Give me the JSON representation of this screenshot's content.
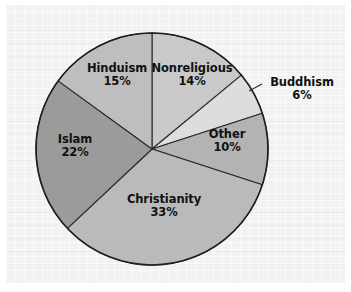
{
  "chart_data": {
    "type": "pie",
    "title": "",
    "subtitle": "",
    "xlabel": "",
    "ylabel": "",
    "legend_position": "none",
    "grid": false,
    "units": "percent",
    "total": 100,
    "start_angle_deg": 0,
    "direction": "clockwise",
    "categories": [
      "Nonreligious",
      "Buddhism",
      "Other",
      "Christianity",
      "Islam",
      "Hinduism"
    ],
    "values": [
      14,
      6,
      10,
      33,
      22,
      15
    ],
    "slices": [
      {
        "label": "Nonreligious",
        "value": 14,
        "pct_text": "14%",
        "color": "#c9c9c9",
        "label_placement": "inside"
      },
      {
        "label": "Buddhism",
        "value": 6,
        "pct_text": "6%",
        "color": "#dddddd",
        "label_placement": "outside",
        "has_leader_line": true
      },
      {
        "label": "Other",
        "value": 10,
        "pct_text": "10%",
        "color": "#b3b3b3",
        "label_placement": "inside"
      },
      {
        "label": "Christianity",
        "value": 33,
        "pct_text": "33%",
        "color": "#bababa",
        "label_placement": "inside"
      },
      {
        "label": "Islam",
        "value": 22,
        "pct_text": "22%",
        "color": "#9b9b9b",
        "label_placement": "inside"
      },
      {
        "label": "Hinduism",
        "value": 15,
        "pct_text": "15%",
        "color": "#bebebe",
        "label_placement": "inside"
      }
    ]
  },
  "figure": {
    "background_color": "#f2f2f2",
    "page_color": "#ffffff",
    "outline_color": "#1f1f1f"
  }
}
